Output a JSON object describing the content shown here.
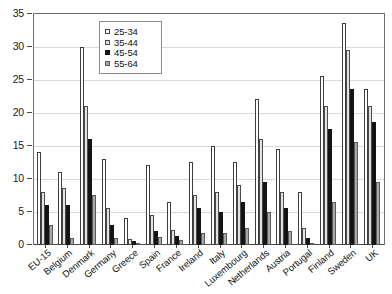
{
  "chart_data": {
    "type": "bar",
    "title": "",
    "subtitle": "",
    "xlabel": "",
    "ylabel": "",
    "ylim": [
      0,
      35
    ],
    "ytick_values": [
      0,
      5,
      10,
      15,
      20,
      25,
      30,
      35
    ],
    "ytick_labels": [
      "0",
      "5",
      "10",
      "15",
      "20",
      "25",
      "30",
      "35"
    ],
    "grid": true,
    "legend_position": "top-center-left",
    "categories": [
      "EU-15",
      "Belgium",
      "Denmark",
      "Germany",
      "Greece",
      "Spain",
      "France",
      "Ireland",
      "Italy",
      "Luxembourg",
      "Netherlands",
      "Austria",
      "Portugal",
      "Finland",
      "Sweden",
      "UK"
    ],
    "series": [
      {
        "name": "25-34",
        "color": "#ffffff",
        "values": [
          14.0,
          11.0,
          30.0,
          13.0,
          4.0,
          12.0,
          6.5,
          12.5,
          15.0,
          12.5,
          22.0,
          14.5,
          8.0,
          25.5,
          33.5,
          23.5
        ]
      },
      {
        "name": "35-44",
        "color": "#e2e2e2",
        "values": [
          8.0,
          8.5,
          21.0,
          5.5,
          0.8,
          4.5,
          2.2,
          7.5,
          8.0,
          9.0,
          16.0,
          8.0,
          2.5,
          21.0,
          29.5,
          21.0
        ]
      },
      {
        "name": "45-54",
        "color": "#141414",
        "values": [
          6.0,
          6.0,
          16.0,
          3.0,
          0.6,
          2.0,
          1.3,
          5.5,
          5.0,
          6.5,
          9.5,
          5.5,
          1.0,
          17.5,
          23.5,
          18.5
        ]
      },
      {
        "name": "55-64",
        "color": "#a8a8a8",
        "values": [
          3.0,
          1.0,
          7.5,
          1.0,
          0.3,
          1.2,
          0.7,
          1.8,
          1.8,
          2.5,
          5.0,
          2.0,
          0.3,
          6.5,
          15.5,
          9.5
        ]
      }
    ]
  },
  "legend": {
    "entries": [
      {
        "label": "25-34"
      },
      {
        "label": "35-44"
      },
      {
        "label": "45-54"
      },
      {
        "label": "55-64"
      }
    ]
  }
}
